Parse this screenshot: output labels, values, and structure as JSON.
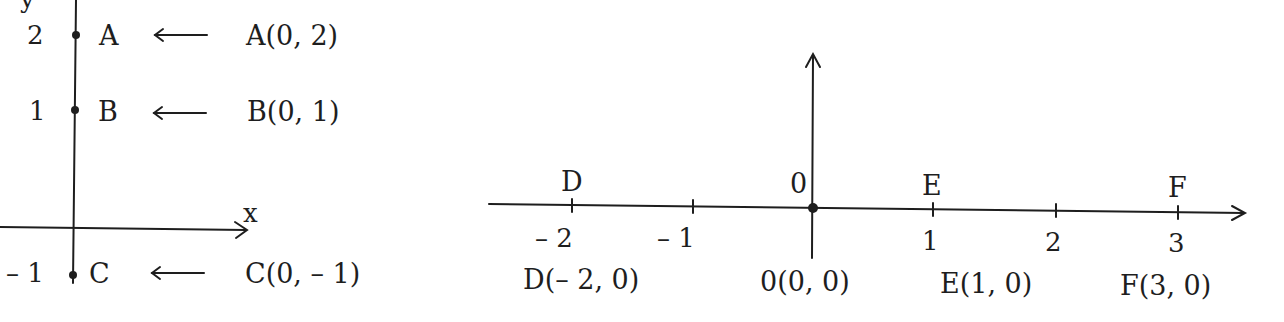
{
  "left_diagram": {
    "axis_labels": {
      "x": "x",
      "y": "y"
    },
    "points": [
      {
        "name": "A",
        "tick": "2",
        "coords": "A(0, 2)",
        "arrow": "⟵"
      },
      {
        "name": "B",
        "tick": "1",
        "coords": "B(0, 1)",
        "arrow": "⟵"
      },
      {
        "name": "C",
        "tick": "– 1",
        "coords": "C(0, – 1)",
        "arrow": "⟵"
      }
    ]
  },
  "right_diagram": {
    "origin_label": "0",
    "ticks": [
      "– 2",
      "– 1",
      "1",
      "2",
      "3"
    ],
    "points": [
      {
        "name": "D",
        "coords": "D(– 2, 0)"
      },
      {
        "name": "0",
        "coords": "0(0, 0)"
      },
      {
        "name": "E",
        "coords": "E(1, 0)"
      },
      {
        "name": "F",
        "coords": "F(3, 0)"
      }
    ]
  },
  "colors": {
    "ink": "#1e1e1e",
    "background": "#ffffff"
  }
}
